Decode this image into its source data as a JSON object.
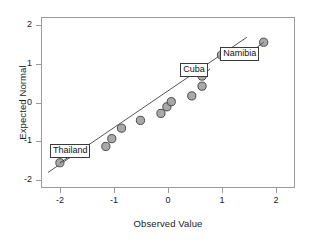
{
  "chart_data": {
    "type": "scatter",
    "title": "",
    "xlabel": "Observed Value",
    "ylabel": "Expected Normal",
    "xlim": [
      -2.35,
      2.35
    ],
    "ylim": [
      -2.2,
      2.2
    ],
    "grid": false,
    "legend": "none",
    "xticks": [
      "-2",
      "-1",
      "0",
      "1",
      "2"
    ],
    "xtick_values": [
      -2,
      -1,
      0,
      1,
      2
    ],
    "yticks": [
      "2",
      "1",
      "0",
      "-1",
      "-2"
    ],
    "ytick_values": [
      2,
      1,
      0,
      -1,
      -2
    ],
    "series": [
      {
        "name": "Cases",
        "marker": "circle",
        "marker_fill": "#9a9a9a",
        "marker_edge": "#4a4a4a",
        "x": [
          -2.0,
          -1.15,
          -1.04,
          -0.86,
          -0.51,
          -0.13,
          -0.02,
          0.06,
          0.44,
          0.63,
          0.63,
          0.99,
          1.77
        ],
        "y": [
          -1.55,
          -1.13,
          -0.93,
          -0.66,
          -0.46,
          -0.28,
          -0.11,
          0.02,
          0.17,
          0.42,
          0.68,
          1.22,
          1.55
        ]
      }
    ],
    "reference_line": {
      "name": "normal-reference-line",
      "color": "#555555",
      "x": [
        -2.22,
        1.46
      ],
      "y": [
        -1.8,
        1.68
      ]
    },
    "annotations": [
      {
        "label": "Thailand",
        "point_x": -2.0,
        "point_y": -1.55,
        "box_x": -1.63,
        "box_y": -1.22
      },
      {
        "label": "Cuba",
        "point_x": 0.63,
        "point_y": 0.68,
        "box_x": 0.78,
        "box_y": 0.87
      },
      {
        "label": "Namibia",
        "point_x": 1.77,
        "point_y": 1.55,
        "box_x": 1.52,
        "box_y": 1.28
      }
    ]
  }
}
